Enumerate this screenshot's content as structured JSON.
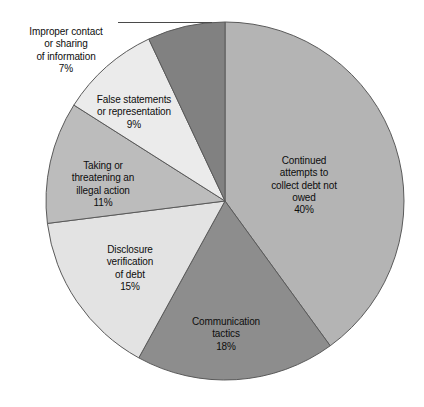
{
  "chart_data": {
    "type": "pie",
    "title": "",
    "subtitle": "",
    "xlabel": "",
    "ylabel": "",
    "legend_position": "none",
    "grid": false,
    "units": "percent",
    "total": 100,
    "categories": [
      "Continued attempts to collect debt not owed",
      "Communication tactics",
      "Disclosure verification of debt",
      "Taking or threatening an illegal action",
      "False statements or representation",
      "Improper contact or sharing of information"
    ],
    "values": [
      40,
      18,
      15,
      11,
      9,
      7
    ],
    "colors": [
      "#b4b4b4",
      "#8d8d8d",
      "#e3e3e3",
      "#bcbcbc",
      "#ebebeb",
      "#818181"
    ],
    "slices": [
      {
        "id": "continued",
        "label": "Continued\nattempts to\ncollect debt not\nowed",
        "percent_text": "40%",
        "value": 40,
        "color": "#b4b4b4",
        "label_position": "inside"
      },
      {
        "id": "communication",
        "label": "Communication\ntactics",
        "percent_text": "18%",
        "value": 18,
        "color": "#8d8d8d",
        "label_position": "inside"
      },
      {
        "id": "disclosure",
        "label": "Disclosure\nverification\nof debt",
        "percent_text": "15%",
        "value": 15,
        "color": "#e3e3e3",
        "label_position": "inside"
      },
      {
        "id": "taking",
        "label": "Taking or\nthreatening an\nillegal action",
        "percent_text": "11%",
        "value": 11,
        "color": "#bcbcbc",
        "label_position": "inside"
      },
      {
        "id": "false",
        "label": "False statements\nor representation",
        "percent_text": "9%",
        "value": 9,
        "color": "#ebebeb",
        "label_position": "inside"
      },
      {
        "id": "improper",
        "label": "Improper contact\nor sharing\nof information",
        "percent_text": "7%",
        "value": 7,
        "color": "#818181",
        "label_position": "outside-left-leader"
      }
    ],
    "geometry": {
      "center_x": 225,
      "center_y": 201,
      "radius": 179,
      "start_angle_deg": -90,
      "direction": "clockwise",
      "stroke": "#5a5a5a"
    }
  }
}
